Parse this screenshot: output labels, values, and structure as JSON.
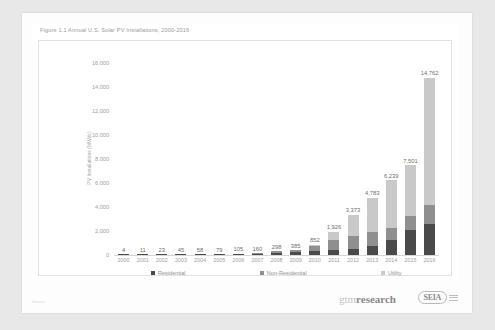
{
  "chart_data": {
    "type": "bar",
    "title": "Figure 1.1 Annual U.S. Solar PV Installations, 2000-2016",
    "xlabel": "",
    "ylabel": "PV Installations (MWdc)",
    "ylim": [
      0,
      16000
    ],
    "yticks": [
      16000,
      14000,
      12000,
      10000,
      8000,
      6000,
      4000,
      2000,
      0
    ],
    "ytick_labels": [
      "16,000",
      "14,000",
      "12,000",
      "10,000",
      "8,000",
      "6,000",
      "4,000",
      "2,000",
      "0"
    ],
    "grid": false,
    "legend_position": "bottom",
    "categories": [
      "2000",
      "2001",
      "2002",
      "2003",
      "2004",
      "2005",
      "2006",
      "2007",
      "2008",
      "2009",
      "2010",
      "2011",
      "2012",
      "2013",
      "2014",
      "2015",
      "2016"
    ],
    "totals": [
      4,
      11,
      23,
      45,
      58,
      79,
      105,
      160,
      298,
      385,
      852,
      1926,
      3373,
      4783,
      6239,
      7501,
      14762
    ],
    "total_labels": [
      "4",
      "11",
      "23",
      "45",
      "58",
      "79",
      "105",
      "160",
      "298",
      "385",
      "852",
      "1,926",
      "3,373",
      "4,783",
      "6,239",
      "7,501",
      "14,762"
    ],
    "series": [
      {
        "name": "Residential",
        "color": "#4a4a4a",
        "values": [
          4,
          11,
          20,
          35,
          45,
          60,
          80,
          110,
          180,
          215,
          310,
          425,
          515,
          790,
          1235,
          2100,
          2585
        ]
      },
      {
        "name": "Non-Residential",
        "color": "#8f8f8f",
        "values": [
          0,
          0,
          3,
          10,
          13,
          19,
          25,
          50,
          118,
          170,
          455,
          800,
          1035,
          1100,
          1055,
          1125,
          1620
        ]
      },
      {
        "name": "Utility",
        "color": "#c9c9c9",
        "values": [
          0,
          0,
          0,
          0,
          0,
          0,
          0,
          0,
          0,
          0,
          87,
          701,
          1823,
          2893,
          3949,
          4276,
          10557
        ]
      }
    ]
  },
  "footer": {
    "note": "Source",
    "brand_gtm_prefix": "gtm",
    "brand_gtm_suffix": "research",
    "brand_seia": "SEIA"
  }
}
